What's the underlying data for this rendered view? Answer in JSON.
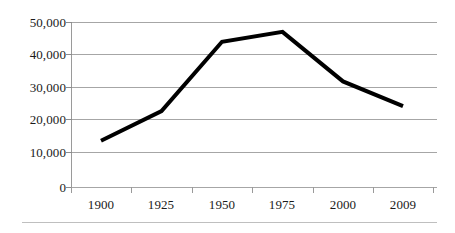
{
  "chart_data": {
    "type": "line",
    "title": "",
    "subtitle": "",
    "xlabel": "",
    "ylabel": "",
    "categories": [
      "1900",
      "1925",
      "1950",
      "1975",
      "2000",
      "2009"
    ],
    "series": [
      {
        "name": "series-1",
        "values": [
          14000,
          23000,
          44000,
          47000,
          32000,
          24500
        ],
        "color": "#000000",
        "line_width": 4
      }
    ],
    "ylim": [
      0,
      50000
    ],
    "y_ticks": [
      0,
      10000,
      20000,
      30000,
      40000,
      50000
    ],
    "y_tick_labels": [
      "0",
      "10,000",
      "20,000",
      "30,000",
      "40,000",
      "50,000"
    ],
    "grid": true,
    "grid_color": "#a6a6a6",
    "legend": "none",
    "axis_color": "#9a9a9a",
    "background": "#ffffff"
  },
  "axes": {
    "y": {
      "ticks": [
        {
          "label": "50,000",
          "value": 50000,
          "y": 22
        },
        {
          "label": "40,000",
          "value": 40000,
          "y": 54
        },
        {
          "label": "30,000",
          "value": 30000,
          "y": 87
        },
        {
          "label": "20,000",
          "value": 20000,
          "y": 119
        },
        {
          "label": "10,000",
          "value": 10000,
          "y": 152
        },
        {
          "label": "0",
          "value": 0,
          "y": 187
        }
      ]
    },
    "x": {
      "ticks": [
        {
          "label": "1900",
          "x": 71
        },
        {
          "label": "1925",
          "x": 131
        },
        {
          "label": "1950",
          "x": 192
        },
        {
          "label": "1975",
          "x": 252
        },
        {
          "label": "2000",
          "x": 313
        },
        {
          "label": "2009",
          "x": 373
        }
      ],
      "end_tick_x": 433
    }
  }
}
